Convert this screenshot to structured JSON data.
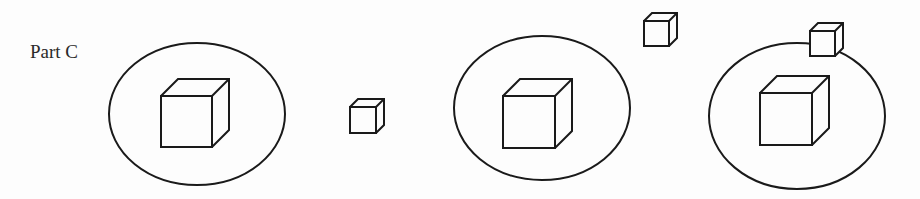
{
  "diagram": {
    "label": "Part C",
    "stroke_color": "#1a1a1a",
    "stroke_width": 2,
    "ellipses": [
      {
        "name": "ellipse-1",
        "cx": 197,
        "cy": 114,
        "rx": 88,
        "ry": 71
      },
      {
        "name": "ellipse-2",
        "cx": 542,
        "cy": 108,
        "rx": 88,
        "ry": 72
      },
      {
        "name": "ellipse-3",
        "cx": 797,
        "cy": 116,
        "rx": 88,
        "ry": 73
      }
    ],
    "cubes": [
      {
        "name": "cube-large-in-ellipse-1",
        "x": 161,
        "y": 96,
        "size": 51,
        "depth": 17,
        "size_class": "large",
        "position": "inside ellipse 1"
      },
      {
        "name": "cube-small-between",
        "x": 350,
        "y": 107,
        "size": 26,
        "depth": 8,
        "size_class": "small",
        "position": "outside, between ellipse 1 and 2"
      },
      {
        "name": "cube-large-in-ellipse-2",
        "x": 503,
        "y": 96,
        "size": 52,
        "depth": 17,
        "size_class": "large",
        "position": "inside ellipse 2"
      },
      {
        "name": "cube-small-above",
        "x": 644,
        "y": 21,
        "size": 25,
        "depth": 8,
        "size_class": "small",
        "position": "outside, above between ellipse 2 and 3"
      },
      {
        "name": "cube-large-in-ellipse-3",
        "x": 760,
        "y": 93,
        "size": 52,
        "depth": 17,
        "size_class": "large",
        "position": "inside ellipse 3"
      },
      {
        "name": "cube-small-on-border",
        "x": 810,
        "y": 31,
        "size": 25,
        "depth": 8,
        "size_class": "small",
        "position": "on the top border of ellipse 3"
      }
    ]
  }
}
